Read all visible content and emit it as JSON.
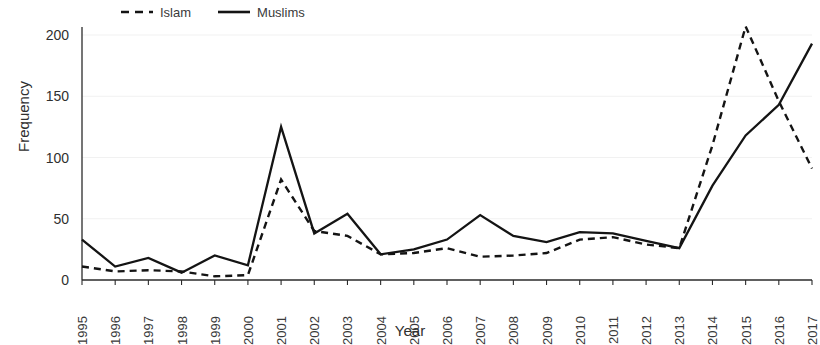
{
  "chart_data": {
    "type": "line",
    "title": "",
    "xlabel": "Year",
    "ylabel": "Frequency",
    "categories": [
      "1995",
      "1996",
      "1997",
      "1998",
      "1999",
      "2000",
      "2001",
      "2002",
      "2003",
      "2004",
      "2005",
      "2006",
      "2007",
      "2008",
      "2009",
      "2010",
      "2011",
      "2012",
      "2013",
      "2014",
      "2015",
      "2016",
      "2017"
    ],
    "series": [
      {
        "name": "Islam",
        "style": "dashed",
        "values": [
          11,
          7,
          8,
          7,
          3,
          4,
          82,
          40,
          36,
          21,
          22,
          26,
          19,
          20,
          22,
          33,
          35,
          29,
          26,
          110,
          207,
          146,
          91
        ]
      },
      {
        "name": "Muslims",
        "style": "solid",
        "values": [
          33,
          11,
          18,
          6,
          20,
          12,
          125,
          38,
          54,
          21,
          25,
          33,
          53,
          36,
          31,
          39,
          38,
          32,
          26,
          77,
          118,
          143,
          193
        ]
      }
    ],
    "ylim": [
      0,
      200
    ],
    "yticks": [
      0,
      50,
      100,
      150,
      200
    ],
    "xlim": [
      "1995",
      "2017"
    ],
    "grid": "horizontal-faint",
    "legend_position": "top",
    "legend": [
      "Islam",
      "Muslims"
    ]
  },
  "axes": {
    "y_title": "Frequency",
    "x_title": "Year",
    "y_tick_labels": [
      "200",
      "150",
      "100",
      "50",
      "0"
    ],
    "x_tick_labels": [
      "1995",
      "1996",
      "1997",
      "1998",
      "1999",
      "2000",
      "2001",
      "2002",
      "2003",
      "2004",
      "2005",
      "2006",
      "2007",
      "2008",
      "2009",
      "2010",
      "2011",
      "2012",
      "2013",
      "2014",
      "2015",
      "2016",
      "2017"
    ]
  },
  "legend": {
    "entries": [
      {
        "label": "Islam",
        "style": "dashed"
      },
      {
        "label": "Muslims",
        "style": "solid"
      }
    ]
  },
  "colors": {
    "series_stroke": "#141414",
    "axis": "#2b2b2b",
    "grid": "#f1f1f1",
    "text": "#2f2f2f",
    "background": "#ffffff"
  }
}
